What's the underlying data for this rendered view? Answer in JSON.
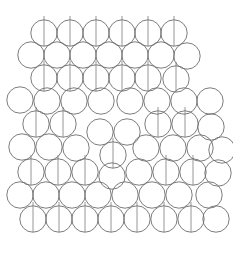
{
  "figure": {
    "title": "",
    "background_color": "#ffffff",
    "width": 233,
    "height": 253
  },
  "style": {
    "disk_stroke_color": "#6e6e6e",
    "disk_stroke_width": 0.9,
    "disk_fill": "none",
    "stem_stroke_color": "#8a8a8a",
    "stem_stroke_width": 0.9,
    "disk_radius": 13.2
  },
  "chart_data": {
    "type": "scatter",
    "title": "",
    "subtitle": "",
    "xlabel": "",
    "ylabel": "",
    "xlim": [
      0,
      233
    ],
    "ylim": [
      0,
      253
    ],
    "grid": false,
    "legend": "none",
    "units": "pixels",
    "marker": "open-circle",
    "marker_radius": 13.2,
    "annotation": "vertical stem segments indicate marked disks",
    "stem_half_length_above": 17,
    "stem_half_length_below": 13,
    "rows": [
      {
        "row_index": 0,
        "y": 33,
        "count": 6,
        "disks": [
          {
            "x": 44,
            "y": 33,
            "stem": true
          },
          {
            "x": 70,
            "y": 33,
            "stem": true
          },
          {
            "x": 96,
            "y": 33,
            "stem": true
          },
          {
            "x": 122,
            "y": 33,
            "stem": true
          },
          {
            "x": 148,
            "y": 33,
            "stem": true
          },
          {
            "x": 174,
            "y": 33,
            "stem": true
          }
        ]
      },
      {
        "row_index": 1,
        "y": 55,
        "count": 7,
        "disks": [
          {
            "x": 31,
            "y": 55,
            "stem": false
          },
          {
            "x": 57,
            "y": 55,
            "stem": false
          },
          {
            "x": 83,
            "y": 55,
            "stem": false
          },
          {
            "x": 109,
            "y": 55,
            "stem": false
          },
          {
            "x": 135,
            "y": 55,
            "stem": false
          },
          {
            "x": 161,
            "y": 55,
            "stem": false
          },
          {
            "x": 187,
            "y": 56,
            "stem": false
          }
        ]
      },
      {
        "row_index": 2,
        "y": 78,
        "count": 6,
        "disks": [
          {
            "x": 44,
            "y": 78,
            "stem": true
          },
          {
            "x": 70,
            "y": 78,
            "stem": true
          },
          {
            "x": 96,
            "y": 78,
            "stem": true
          },
          {
            "x": 122,
            "y": 78,
            "stem": true
          },
          {
            "x": 148,
            "y": 78,
            "stem": true
          },
          {
            "x": 176,
            "y": 79,
            "stem": true
          }
        ]
      },
      {
        "row_index": 3,
        "y": 100,
        "count": 8,
        "disks": [
          {
            "x": 20,
            "y": 100,
            "stem": false
          },
          {
            "x": 47,
            "y": 101,
            "stem": false
          },
          {
            "x": 74,
            "y": 101,
            "stem": false
          },
          {
            "x": 101,
            "y": 101,
            "stem": false
          },
          {
            "x": 130,
            "y": 101,
            "stem": false
          },
          {
            "x": 157,
            "y": 101,
            "stem": false
          },
          {
            "x": 184,
            "y": 101,
            "stem": false
          },
          {
            "x": 210,
            "y": 101,
            "stem": false
          }
        ]
      },
      {
        "row_index": 4,
        "y": 125,
        "count": 7,
        "disks": [
          {
            "x": 36,
            "y": 124,
            "stem": true
          },
          {
            "x": 63,
            "y": 124,
            "stem": true
          },
          {
            "x": 100,
            "y": 132,
            "stem": false
          },
          {
            "x": 127,
            "y": 132,
            "stem": false
          },
          {
            "x": 158,
            "y": 124,
            "stem": true
          },
          {
            "x": 185,
            "y": 124,
            "stem": true
          },
          {
            "x": 211,
            "y": 127,
            "stem": false
          }
        ]
      },
      {
        "row_index": 5,
        "y": 148,
        "count": 8,
        "disks": [
          {
            "x": 22,
            "y": 147,
            "stem": false
          },
          {
            "x": 49,
            "y": 147,
            "stem": false
          },
          {
            "x": 76,
            "y": 148,
            "stem": false
          },
          {
            "x": 113,
            "y": 155,
            "stem": true
          },
          {
            "x": 146,
            "y": 148,
            "stem": false
          },
          {
            "x": 173,
            "y": 148,
            "stem": false
          },
          {
            "x": 200,
            "y": 148,
            "stem": false
          },
          {
            "x": 222,
            "y": 150,
            "stem": false
          }
        ]
      },
      {
        "row_index": 6,
        "y": 172,
        "count": 8,
        "disks": [
          {
            "x": 31,
            "y": 172,
            "stem": true
          },
          {
            "x": 58,
            "y": 172,
            "stem": true
          },
          {
            "x": 85,
            "y": 172,
            "stem": true
          },
          {
            "x": 112,
            "y": 176,
            "stem": false
          },
          {
            "x": 139,
            "y": 172,
            "stem": false
          },
          {
            "x": 166,
            "y": 172,
            "stem": true
          },
          {
            "x": 193,
            "y": 172,
            "stem": true
          },
          {
            "x": 218,
            "y": 173,
            "stem": false
          }
        ]
      },
      {
        "row_index": 7,
        "y": 195,
        "count": 8,
        "disks": [
          {
            "x": 20,
            "y": 195,
            "stem": false
          },
          {
            "x": 46,
            "y": 195,
            "stem": false
          },
          {
            "x": 72,
            "y": 195,
            "stem": false
          },
          {
            "x": 98,
            "y": 195,
            "stem": false
          },
          {
            "x": 125,
            "y": 195,
            "stem": false
          },
          {
            "x": 152,
            "y": 195,
            "stem": false
          },
          {
            "x": 179,
            "y": 195,
            "stem": false
          },
          {
            "x": 209,
            "y": 195,
            "stem": false
          }
        ]
      },
      {
        "row_index": 8,
        "y": 219,
        "count": 8,
        "disks": [
          {
            "x": 33,
            "y": 219,
            "stem": true
          },
          {
            "x": 59,
            "y": 219,
            "stem": true
          },
          {
            "x": 85,
            "y": 219,
            "stem": true
          },
          {
            "x": 111,
            "y": 219,
            "stem": true
          },
          {
            "x": 137,
            "y": 219,
            "stem": true
          },
          {
            "x": 164,
            "y": 219,
            "stem": true
          },
          {
            "x": 191,
            "y": 219,
            "stem": true
          },
          {
            "x": 216,
            "y": 219,
            "stem": false
          }
        ]
      }
    ]
  }
}
